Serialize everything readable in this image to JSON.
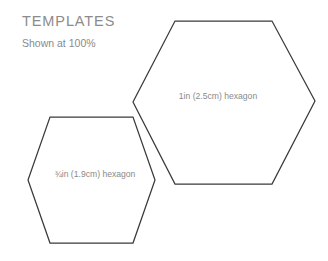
{
  "header": {
    "title": "TEMPLATES",
    "subtitle": "Shown at 100%"
  },
  "colors": {
    "background": "#ffffff",
    "stroke": "#3a3a3a",
    "text": "#8a8a8a",
    "title_text": "#8c8c8c"
  },
  "shapes": {
    "large_hexagon": {
      "label": "1in (2.5cm) hexagon",
      "orientation": "flat-top",
      "points": "175,21 272,21 315,101 272,184 175,184 133,102",
      "label_x": 218,
      "label_y": 97
    },
    "small_hexagon": {
      "label": "¾in (1.9cm) hexagon",
      "orientation": "flat-top",
      "points": "50,117 133,117 155,180 133,243 50,243 28,180",
      "label_x": 95,
      "label_y": 175
    }
  }
}
